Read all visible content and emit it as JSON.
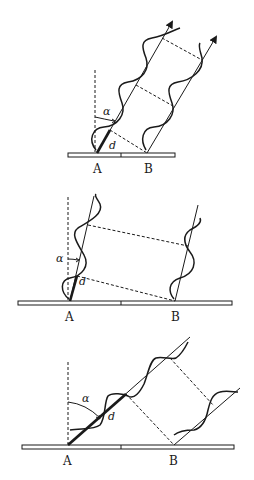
{
  "figure": {
    "colors": {
      "ink": "#1a1a1a",
      "plate_fill": "#ffffff",
      "background": "#ffffff"
    },
    "panels": [
      {
        "id": "top",
        "labels": {
          "point_a": "A",
          "point_b": "B",
          "angle": "α",
          "distance": "d"
        },
        "angle_size": "small",
        "arrows": true
      },
      {
        "id": "middle",
        "labels": {
          "point_a": "A",
          "point_b": "B",
          "angle": "α",
          "distance": "d"
        },
        "angle_size": "very small",
        "arrows": false
      },
      {
        "id": "bottom",
        "labels": {
          "point_a": "A",
          "point_b": "B",
          "angle": "α",
          "distance": "d"
        },
        "angle_size": "large",
        "arrows": false
      }
    ]
  }
}
